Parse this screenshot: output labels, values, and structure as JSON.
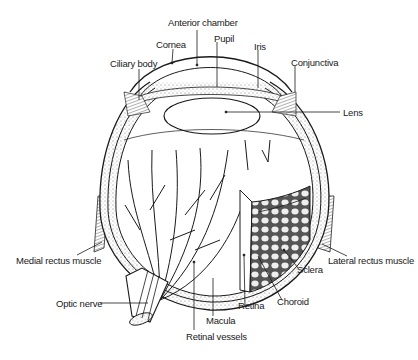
{
  "diagram": {
    "labels": {
      "anterior_chamber": "Anterior chamber",
      "cornea": "Cornea",
      "pupil": "Pupil",
      "iris": "Iris",
      "ciliary_body": "Ciliary body",
      "conjunctiva": "Conjunctiva",
      "lens": "Lens",
      "medial_rectus_muscle": "Medial rectus muscle",
      "lateral_rectus_muscle": "Lateral rectus muscle",
      "sclera": "Sclera",
      "optic_nerve": "Optic nerve",
      "choroid": "Choroid",
      "retina": "Retina",
      "macula": "Macula",
      "retinal_vessels": "Retinal vessels"
    },
    "colors": {
      "line": "#1a1a1a",
      "background": "#ffffff",
      "shade": "#bdbdbd"
    }
  }
}
